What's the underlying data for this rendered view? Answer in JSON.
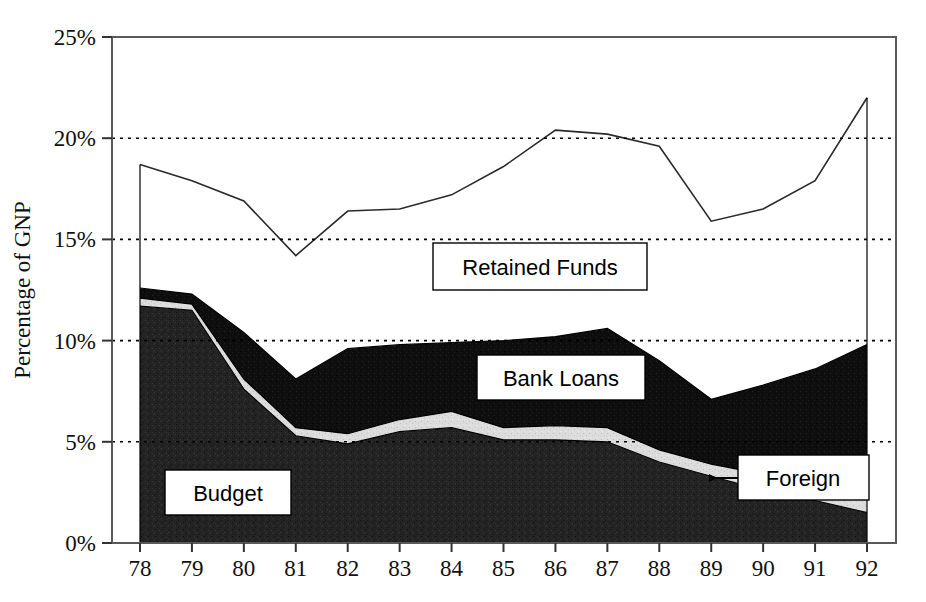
{
  "chart_data": {
    "type": "area",
    "title": "",
    "subtitle": "",
    "xlabel": "",
    "ylabel": "Percentage of GNP",
    "categories": [
      "78",
      "79",
      "80",
      "81",
      "82",
      "83",
      "84",
      "85",
      "86",
      "87",
      "88",
      "89",
      "90",
      "91",
      "92"
    ],
    "x_tick_labels": [
      "78",
      "79",
      "80",
      "81",
      "82",
      "83",
      "84",
      "85",
      "86",
      "87",
      "88",
      "89",
      "90",
      "91",
      "92"
    ],
    "y_tick_labels": [
      "0%",
      "5%",
      "10%",
      "15%",
      "20%",
      "25%"
    ],
    "y_tick_values": [
      0,
      5,
      10,
      15,
      20,
      25
    ],
    "ylim": [
      0,
      25
    ],
    "y_unit": "%",
    "grid": "horizontal-dotted",
    "legend_position": "inline-annotations",
    "stacked": true,
    "series": [
      {
        "name": "Budget",
        "fill": "#1c1c1c",
        "values": [
          11.7,
          11.5,
          7.6,
          5.3,
          4.9,
          5.5,
          5.7,
          5.1,
          5.1,
          5.0,
          4.0,
          3.3,
          2.6,
          2.1,
          1.5
        ]
      },
      {
        "name": "Foreign",
        "fill": "#d4d4d4",
        "values": [
          0.4,
          0.3,
          0.5,
          0.4,
          0.5,
          0.6,
          0.8,
          0.6,
          0.7,
          0.7,
          0.6,
          0.6,
          0.8,
          1.1,
          1.5
        ]
      },
      {
        "name": "Bank Loans",
        "fill": "#0d0d0d",
        "values": [
          0.5,
          0.5,
          2.3,
          2.4,
          4.2,
          3.7,
          3.4,
          4.3,
          4.4,
          4.9,
          4.4,
          3.2,
          4.4,
          5.4,
          6.8
        ]
      },
      {
        "name": "Retained Funds",
        "fill": "#ffffff",
        "values": [
          6.1,
          5.6,
          6.5,
          6.1,
          6.8,
          6.7,
          7.3,
          8.6,
          10.2,
          9.6,
          10.6,
          8.8,
          8.7,
          9.3,
          12.2
        ]
      }
    ],
    "cumulative_tops": {
      "budget": [
        11.7,
        11.5,
        7.6,
        5.3,
        4.9,
        5.5,
        5.7,
        5.1,
        5.1,
        5.0,
        4.0,
        3.3,
        2.6,
        2.1,
        1.5
      ],
      "foreign": [
        12.1,
        11.8,
        8.1,
        5.7,
        5.4,
        6.1,
        6.5,
        5.7,
        5.8,
        5.7,
        4.6,
        3.9,
        3.4,
        3.2,
        3.0
      ],
      "bank_loans": [
        12.6,
        12.3,
        10.4,
        8.1,
        9.6,
        9.8,
        9.9,
        10.0,
        10.2,
        10.6,
        9.0,
        7.1,
        7.8,
        8.6,
        9.8
      ],
      "total": [
        18.7,
        17.9,
        16.9,
        14.2,
        16.4,
        16.5,
        17.2,
        18.6,
        20.4,
        20.2,
        19.6,
        15.9,
        16.5,
        17.9,
        22.0
      ]
    }
  },
  "annotations": {
    "retained_funds": {
      "label": "Retained Funds"
    },
    "bank_loans": {
      "label": "Bank Loans"
    },
    "foreign": {
      "label": "Foreign",
      "has_arrow": true,
      "arrow_direction": "left"
    },
    "budget": {
      "label": "Budget"
    }
  },
  "axis": {
    "y_title": "Percentage of GNP"
  },
  "colors": {
    "budget": "#1c1c1c",
    "foreign": "#d4d4d4",
    "bank_loans": "#0d0d0d",
    "retained_funds": "#ffffff",
    "axis": "#5a5a5a",
    "gridline": "#000000",
    "text": "#111111"
  }
}
